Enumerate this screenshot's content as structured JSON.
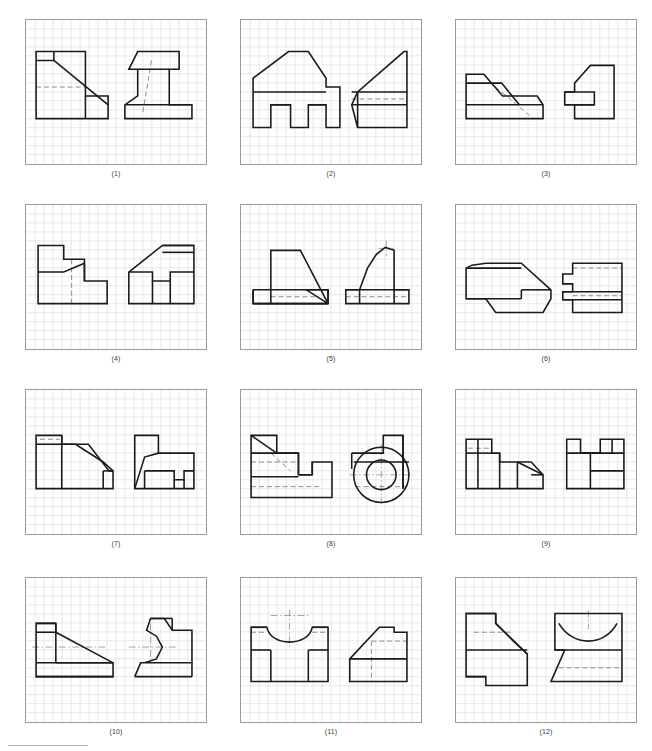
{
  "sheet": {
    "title": "Orthographic projection exercise sheet",
    "panel_count": 12,
    "grid": {
      "cols": 3,
      "rows": 4,
      "panel_width": 182,
      "panel_height": 146,
      "cell_size": 9.1,
      "grid_color": "#d8d8de",
      "grid_minor_color": "#e6e6ec",
      "border_color": "#9a9a9a",
      "line_color": "#1a1a1a",
      "hidden_color": "#8d8d8d",
      "center_color": "#8d8d8d",
      "background": "#ffffff"
    },
    "footer_rule": true,
    "captions": [
      "(1)",
      "(2)",
      "(3)",
      "(4)",
      "(5)",
      "(6)",
      "(7)",
      "(8)",
      "(9)",
      "(10)",
      "(11)",
      "(12)"
    ]
  },
  "panels": [
    {
      "caption": "(1)",
      "views": [
        {
          "name": "front-view",
          "solid": [
            "M 10,32 L 10,100 L 83,100 L 83,77 L 60,77 L 60,32 Z",
            "M 10,41 L 28,41 L 28,32",
            "M 28,41 L 83,86",
            "M 60,77 L 60,100"
          ],
          "hidden": [
            "M 10,68 L 60,68"
          ],
          "center": []
        },
        {
          "name": "side-view",
          "solid": [
            "M 113,32 L 104,50 L 113,50 L 113,77 L 100,86 L 100,100 L 168,100 L 168,86 L 145,86 L 145,50 L 155,50 L 155,32 Z",
            "M 100,86 L 168,86",
            "M 113,50 L 145,50"
          ],
          "hidden": [
            "M 127,41 L 118,95"
          ],
          "center": []
        }
      ]
    },
    {
      "caption": "(2)",
      "views": [
        {
          "name": "front-view",
          "solid": [
            "M 12,73 L 12,59 L 48,32 L 68,32 L 86,59 L 86,68 L 100,68 L 100,109 L 86,109 L 86,86 L 68,86 L 68,109 L 50,109 L 50,86 L 30,86 L 30,109 L 12,109 Z",
            "M 30,86 L 50,86",
            "M 68,86 L 86,86",
            "M 12,73 L 86,73"
          ],
          "hidden": [],
          "center": []
        },
        {
          "name": "side-view",
          "solid": [
            "M 118,109 L 112,86 L 118,73 L 165,32 L 168,32 L 168,109 Z",
            "M 112,86 L 168,86",
            "M 112,73 L 168,73",
            "M 118,73 L 118,109"
          ],
          "hidden": [
            "M 112,80 L 168,80"
          ],
          "center": []
        }
      ]
    },
    {
      "caption": "(3)",
      "views": [
        {
          "name": "front-view",
          "solid": [
            "M 10,55 L 10,100 L 88,100 L 88,86 L 82,77 L 47,77 L 28,55 Z",
            "M 10,64 L 46,64 L 64,86 L 88,86",
            "M 10,86 L 64,86"
          ],
          "hidden": [
            "M 40,68 L 78,100"
          ],
          "center": []
        },
        {
          "name": "side-view",
          "solid": [
            "M 110,73 L 110,86 L 120,86 L 120,100 L 160,100 L 160,46 L 136,46 L 128,55 L 120,64 L 120,73 Z",
            "M 110,73 L 140,73 L 140,86 L 110,86",
            "M 120,86 L 140,86"
          ],
          "hidden": [],
          "center": []
        }
      ]
    },
    {
      "caption": "(4)",
      "views": [
        {
          "name": "front-view",
          "solid": [
            "M 12,41 L 12,100 L 82,100 L 82,77 L 59,77 L 59,55 L 38,55 L 38,41 Z",
            "M 12,68 L 38,68 L 59,59",
            "M 59,59 L 59,77"
          ],
          "hidden": [
            "M 46,55 L 46,100"
          ],
          "center": []
        },
        {
          "name": "side-view",
          "solid": [
            "M 104,100 L 104,68 L 138,41 L 170,41 L 170,100 Z",
            "M 104,68 L 128,68 L 128,77 L 146,77 L 146,68 L 170,68",
            "M 128,100 L 128,77",
            "M 146,100 L 146,77",
            "M 138,41 L 170,41",
            "M 138,48 L 170,48"
          ],
          "hidden": [],
          "center": []
        }
      ]
    },
    {
      "caption": "(5)",
      "views": [
        {
          "name": "front-view",
          "solid": [
            "M 12,86 L 12,100 L 88,100 L 88,86 L 66,86 L 66,86 L 88,100",
            "M 12,86 L 88,86",
            "M 12,100 L 88,100",
            "M 12,86 L 12,100",
            "M 88,86 L 88,100",
            "M 30,86 L 30,46 L 60,46 L 88,100",
            "M 30,86 L 30,100"
          ],
          "hidden": [
            "M 30,93 L 78,93"
          ],
          "center": []
        },
        {
          "name": "side-view",
          "solid": [
            "M 106,86 L 106,100 L 170,100 L 170,86 L 155,86 L 155,46 L 146,43 L 137,50 L 128,64 L 120,86 Z",
            "M 106,86 L 170,86",
            "M 120,86 L 120,100",
            "M 155,86 L 155,100"
          ],
          "hidden": [
            "M 106,93 L 170,93"
          ],
          "center": [
            "M 147,36 L 147,52",
            "M 139,44 L 155,44"
          ]
        }
      ]
    },
    {
      "caption": "(6)",
      "views": [
        {
          "name": "front-view",
          "solid": [
            "M 10,64 L 10,95 L 30,95 L 40,109 L 88,109 L 96,95 L 96,86 L 66,59 L 30,59 L 16,61 Z",
            "M 10,64 L 66,64",
            "M 10,95 L 66,95",
            "M 66,86 L 96,86",
            "M 66,86 L 66,95"
          ],
          "hidden": [],
          "center": []
        },
        {
          "name": "side-view",
          "solid": [
            "M 118,59 L 168,59 L 168,109 L 118,109 L 118,96 L 108,96 L 108,88 L 118,88 L 118,80 L 108,80 L 108,70 L 118,70 Z",
            "M 108,88 L 168,88",
            "M 108,96 L 168,96"
          ],
          "hidden": [
            "M 118,64 L 168,64",
            "M 118,92 L 168,92"
          ],
          "center": []
        }
      ]
    },
    {
      "caption": "(7)",
      "views": [
        {
          "name": "front-view",
          "solid": [
            "M 10,46 L 10,100 L 88,100 L 88,82 L 78,73 L 50,55 L 36,55 L 36,46 Z",
            "M 10,55 L 36,55",
            "M 36,46 L 36,100",
            "M 36,55 L 63,55 L 84,82 L 88,82",
            "M 78,82 L 88,82",
            "M 78,82 L 78,100"
          ],
          "hidden": [
            "M 14,50 L 34,50"
          ],
          "center": []
        },
        {
          "name": "side-view",
          "solid": [
            "M 110,46 L 110,100 L 170,100 L 170,64 L 134,64 L 134,46 Z",
            "M 110,100 L 120,68 L 134,64",
            "M 120,82 L 150,82 L 150,91 L 160,91 L 160,82 L 170,82",
            "M 120,82 L 120,100",
            "M 150,91 L 150,100",
            "M 160,91 L 160,100"
          ],
          "hidden": [],
          "center": []
        }
      ]
    },
    {
      "caption": "(8)",
      "views": [
        {
          "name": "front-view",
          "solid": [
            "M 10,46 L 10,109 L 92,109 L 92,73 L 72,73 L 72,86 L 58,86 L 58,64 L 36,64 L 36,46 Z",
            "M 10,64 L 58,64",
            "M 58,64 L 58,86",
            "M 10,46 L 36,64",
            "M 72,73 L 72,86",
            "M 58,86 L 72,86",
            "M 10,88 L 58,88"
          ],
          "hidden": [
            "M 10,73 L 58,73",
            "M 10,98 L 80,98",
            "M 30,64 L 50,82"
          ],
          "center": []
        },
        {
          "name": "side-view",
          "solid": [
            "M 112,64 L 144,64 L 144,46 L 164,46 L 164,100",
            "CIRCLE 142,86,28",
            "CIRCLE 142,86,15",
            "M 112,64 L 112,80",
            "M 114,73 L 170,73",
            "M 164,46 L 164,100"
          ],
          "hidden": [
            "M 116,98 L 168,98"
          ],
          "center": [
            "M 142,55 L 142,118",
            "M 110,86 L 174,86"
          ]
        }
      ]
    },
    {
      "caption": "(9)",
      "views": [
        {
          "name": "front-view",
          "solid": [
            "M 10,50 L 10,100 L 88,100 L 88,86 L 76,73 L 44,73 L 44,64 L 36,64 L 36,50 Z",
            "M 10,64 L 36,64",
            "M 22,50 L 22,100",
            "M 44,64 L 44,100",
            "M 62,73 L 62,100",
            "M 62,73 L 88,86",
            "M 76,86 L 88,86"
          ],
          "hidden": [
            "M 12,59 L 34,59"
          ],
          "center": []
        },
        {
          "name": "side-view",
          "solid": [
            "M 112,50 L 112,100 L 170,100 L 170,50 L 146,50 L 146,64 L 126,64 L 126,50 Z",
            "M 112,64 L 170,64",
            "M 126,64 L 146,64",
            "M 158,50 L 158,64",
            "M 136,64 L 136,100",
            "M 136,82 L 170,82"
          ],
          "hidden": [],
          "center": []
        }
      ]
    },
    {
      "caption": "(10)",
      "views": [
        {
          "name": "front-view",
          "solid": [
            "M 10,46 L 10,100 L 88,100 L 88,86 L 30,86 L 30,55 L 30,46 Z",
            "M 10,55 L 30,55",
            "M 30,46 L 30,55",
            "M 10,46 L 30,46",
            "M 30,55 L 88,86",
            "M 10,86 L 88,86",
            "M 10,100 L 88,100"
          ],
          "hidden": [],
          "center": [
            "M 6,70 L 80,70"
          ]
        },
        {
          "name": "side-view",
          "solid": [
            "M 110,100 L 116,86 L 168,86 L 168,53 L 148,53 L 140,41 L 126,41 L 122,53 L 132,59 L 138,70 L 132,82 L 120,86",
            "M 110,100 L 168,100",
            "M 168,86 L 168,100",
            "M 126,41 L 148,41",
            "M 148,41 L 148,53"
          ],
          "hidden": [],
          "center": [
            "M 104,70 L 152,70",
            "M 126,46 L 126,86"
          ]
        }
      ]
    },
    {
      "caption": "(11)",
      "views": [
        {
          "name": "front-view",
          "solid": [
            "M 10,50 L 10,105 L 88,105 L 88,50 L 72,50 C 68,70 30,70 26,50 Z",
            "M 10,73 L 30,73",
            "M 68,73 L 88,73",
            "M 30,73 L 30,105",
            "M 68,73 L 68,105",
            "M 10,50 L 26,50",
            "M 72,50 L 88,50"
          ],
          "hidden": [
            "M 10,55 L 26,55",
            "M 72,55 L 88,55"
          ],
          "center": [
            "M 49,32 L 49,72",
            "M 30,38 L 68,38"
          ]
        },
        {
          "name": "side-view",
          "solid": [
            "M 110,105 L 110,82 L 140,50 L 155,50 L 155,55 L 168,55 L 168,105 Z",
            "M 110,82 L 168,82"
          ],
          "hidden": [
            "M 132,64 L 168,64",
            "M 132,64 L 132,105"
          ],
          "center": []
        }
      ]
    },
    {
      "caption": "(12)",
      "views": [
        {
          "name": "front-view",
          "solid": [
            "M 10,46 L 10,100 L 30,100 L 30,109 L 72,109 L 72,77 L 58,64 L 40,46 L 40,36 L 10,36 Z",
            "M 10,36 L 40,36",
            "M 40,36 L 40,46",
            "M 10,73 L 72,73",
            "M 40,46 L 72,77",
            "M 10,100 L 30,100"
          ],
          "hidden": [
            "M 18,55 L 58,55"
          ],
          "center": []
        },
        {
          "name": "side-view",
          "solid": [
            "M 100,36 L 168,36 L 168,105 L 96,105 L 110,73 L 100,73 Z",
            "M 100,73 L 168,73",
            "M 104,46 C 118,70 150,70 163,46"
          ],
          "hidden": [
            "M 104,91 L 168,91"
          ],
          "center": [
            "M 134,33 L 134,52"
          ]
        }
      ]
    }
  ]
}
